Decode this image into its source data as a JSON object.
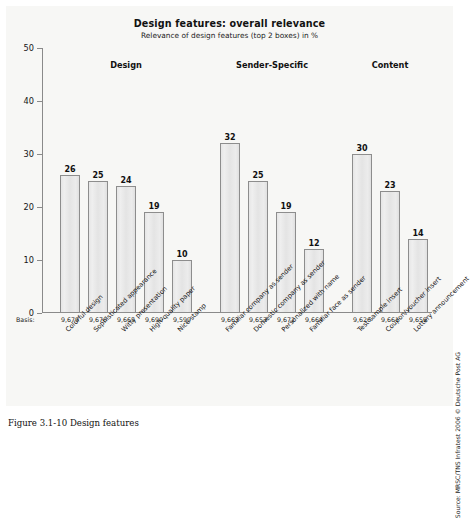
{
  "chart_data": {
    "type": "bar",
    "title": "Design features: overall relevance",
    "subtitle": "Relevance of design features (top 2 boxes) in %",
    "xlabel": "",
    "ylabel": "",
    "ylim": [
      0,
      50
    ],
    "yticks": [
      0,
      10,
      20,
      30,
      40,
      50
    ],
    "ytick_labels": [
      "0",
      "10",
      "20",
      "30",
      "40",
      "50"
    ],
    "grid": false,
    "legend": false,
    "categories": [
      "Colorful design",
      "Sophisticated appearance",
      "Witty presentation",
      "High-quality paper",
      "Nice stamp",
      "Familiar company as sender",
      "Domestic company as sender",
      "Personalized with name",
      "Familiar face as sender",
      "Test sample insert",
      "Coupon/voucher insert",
      "Lottery announcement"
    ],
    "values": [
      26,
      25,
      24,
      19,
      10,
      32,
      25,
      19,
      12,
      30,
      23,
      14
    ],
    "basis_label": "Basis:",
    "basis": [
      "9,679",
      "9,670",
      "9,665",
      "9,690",
      "9,599",
      "9,663",
      "9,653",
      "9,672",
      "9,664",
      "9,626",
      "9,661",
      "9,659"
    ],
    "groups": [
      {
        "label": "Design",
        "start": 0,
        "count": 5
      },
      {
        "label": "Sender-Specific",
        "start": 5,
        "count": 4
      },
      {
        "label": "Content",
        "start": 9,
        "count": 3
      }
    ],
    "bar_color": "#e7e7e7",
    "bar_edge_color": "#8d8d8d",
    "axis_color": "#8a8a8a",
    "background_color": "#f7f7f5"
  },
  "source_note": "Source: MRSC/TNS Infratest 2006 © Deutsche Post AG",
  "caption": {
    "number": "Figure 3.1-10",
    "text": "Design features"
  }
}
